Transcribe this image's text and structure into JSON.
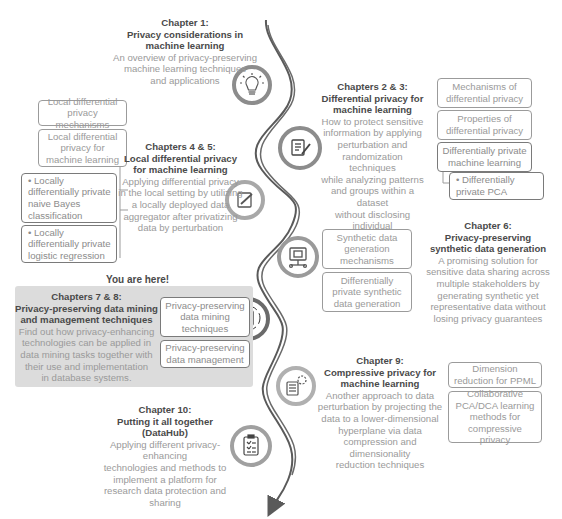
{
  "chapters": {
    "ch1": {
      "number": "Chapter 1:",
      "title_lines": [
        "Privacy considerations in",
        "machine learning"
      ],
      "desc_lines": [
        "An overview of privacy-preserving",
        "machine learning techniques",
        "and applications"
      ],
      "icon": "lightbulb-icon"
    },
    "ch23": {
      "number": "Chapters 2 & 3:",
      "title_lines": [
        "Differential privacy for",
        "machine learning"
      ],
      "desc_lines": [
        "How to protect sensitive",
        "information by applying",
        "perturbation and",
        "randomization techniques",
        "while analyzing patterns",
        "and groups within a dataset",
        "without disclosing individual",
        "information"
      ],
      "icon": "document-edit-icon",
      "topics": [
        "Mechanisms of differential privacy",
        "Properties of differential privacy",
        "Differentially private machine learning",
        "• Differentially private PCA"
      ]
    },
    "ch45": {
      "number": "Chapters 4 & 5:",
      "title_lines": [
        "Local differential privacy",
        "for machine learning"
      ],
      "desc_lines": [
        "Applying differential privacy",
        "in the local setting by utilizing",
        "a locally deployed data",
        "aggregator after privatizing",
        "data by perturbation"
      ],
      "icon": "edit-note-icon",
      "topics": [
        "Local differential privacy mechanisms",
        "Local differential privacy for machine learning",
        "• Locally differentially private naive Bayes classification",
        "• Locally differentially private logistic regression"
      ]
    },
    "ch6": {
      "number": "Chapter 6:",
      "title_lines": [
        "Privacy-preserving",
        "synthetic data generation"
      ],
      "desc_lines": [
        "A promising solution for",
        "sensitive data sharing across",
        "multiple stakeholders by",
        "generating synthetic yet",
        "representative data without",
        "losing privacy guarantees"
      ],
      "icon": "monitor-network-icon",
      "topics": [
        "Synthetic data generation mechanisms",
        "Differentially private synthetic data generation"
      ]
    },
    "ch78": {
      "here_label": "You are here!",
      "number": "Chapters 7 & 8:",
      "title_lines": [
        "Privacy-preserving data mining",
        "and management techniques"
      ],
      "desc_lines": [
        "Find out how privacy-enhancing",
        "technologies can be applied in",
        "data mining tasks together with",
        "their use and implementation",
        "in database systems."
      ],
      "icon": "document-cycle-icon",
      "topics": [
        "Privacy-preserving data mining techniques",
        "Privacy-preserving data management"
      ]
    },
    "ch9": {
      "number": "Chapter 9:",
      "title_lines": [
        "Compressive privacy for",
        "machine learning"
      ],
      "desc_lines": [
        "Another approach to data",
        "perturbation by projecting the",
        "data to a lower-dimensional",
        "hyperplane via data",
        "compression and dimensionality",
        "reduction techniques"
      ],
      "icon": "document-gear-icon",
      "topics": [
        "Dimension reduction for PPML",
        "Collaborative PCA/DCA learning methods for compressive privacy"
      ]
    },
    "ch10": {
      "number": "Chapter 10:",
      "title_lines": [
        "Putting it all together (DataHub)"
      ],
      "desc_lines": [
        "Applying different privacy-enhancing",
        "technologies and methods to",
        "implement a platform for",
        "research data protection and",
        "sharing"
      ],
      "icon": "clipboard-checklist-icon"
    }
  },
  "colors": {
    "path": "#5a5a5a",
    "ring": "#8c8c8c",
    "ring_light": "#b0b0b0",
    "title": "#4a4a4a",
    "desc": "#9a9a9a",
    "highlight_bg": "#dcdcdc"
  }
}
